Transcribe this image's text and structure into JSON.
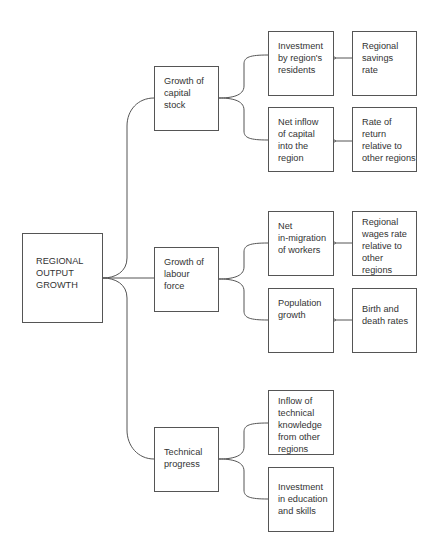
{
  "diagram": {
    "root": {
      "id": "root",
      "label": "REGIONAL\nOUTPUT\nGROWTH"
    },
    "branches": [
      {
        "id": "capital",
        "label": "Growth of\ncapital\nstock",
        "children": [
          {
            "id": "investment-residents",
            "label": "Investment\nby region's\nresidents",
            "influenced_by": {
              "id": "savings-rate",
              "label": "Regional\nsavings\nrate"
            }
          },
          {
            "id": "net-inflow-capital",
            "label": "Net inflow\nof capital\ninto the\nregion",
            "influenced_by": {
              "id": "rate-of-return",
              "label": "Rate of\nreturn\nrelative to\nother regions"
            }
          }
        ]
      },
      {
        "id": "labour",
        "label": "Growth of\nlabour\nforce",
        "children": [
          {
            "id": "net-in-migration",
            "label": "Net\nin-migration\nof workers",
            "influenced_by": {
              "id": "wages-rate",
              "label": "Regional\nwages rate\nrelative to\nother\nregions"
            }
          },
          {
            "id": "population-growth",
            "label": "Population\ngrowth",
            "influenced_by": {
              "id": "birth-death",
              "label": "Birth and\ndeath rates"
            }
          }
        ]
      },
      {
        "id": "technical",
        "label": "Technical\nprogress",
        "children": [
          {
            "id": "inflow-knowledge",
            "label": "Inflow of\ntechnical\nknowledge\nfrom other\nregions"
          },
          {
            "id": "investment-education",
            "label": "Investment\nin education\nand skills"
          }
        ]
      }
    ],
    "colors": {
      "line": "#555555",
      "text": "#333333",
      "background": "#ffffff"
    }
  }
}
